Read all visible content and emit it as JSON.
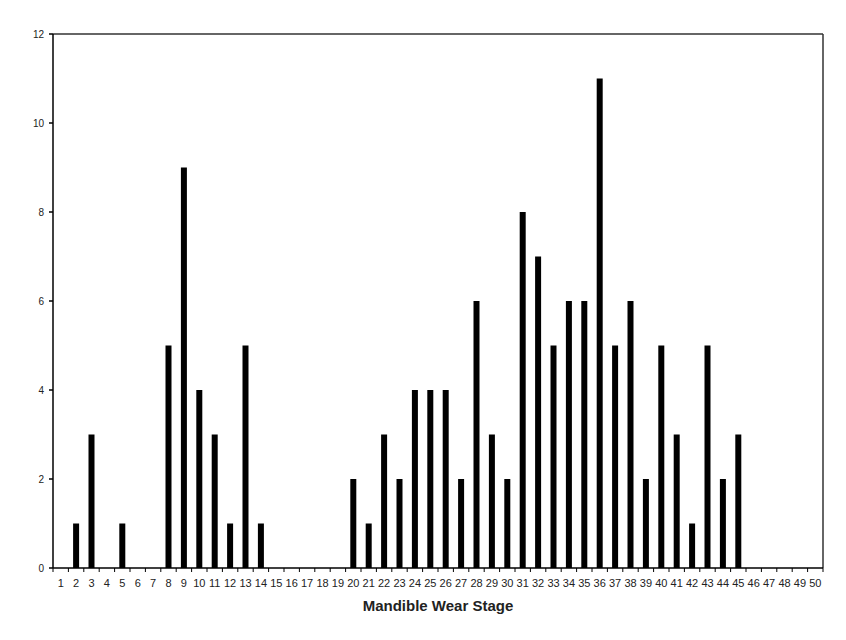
{
  "chart_data": {
    "type": "bar",
    "title": "",
    "xlabel": "Mandible Wear Stage",
    "ylabel": "",
    "ylim": [
      0,
      12
    ],
    "yticks": [
      0,
      2,
      4,
      6,
      8,
      10,
      12
    ],
    "grid": false,
    "legend": null,
    "bar_color": "#000000",
    "categories": [
      "1",
      "2",
      "3",
      "4",
      "5",
      "6",
      "7",
      "8",
      "9",
      "10",
      "11",
      "12",
      "13",
      "14",
      "15",
      "16",
      "17",
      "18",
      "19",
      "20",
      "21",
      "22",
      "23",
      "24",
      "25",
      "26",
      "27",
      "28",
      "29",
      "30",
      "31",
      "32",
      "33",
      "34",
      "35",
      "36",
      "37",
      "38",
      "39",
      "40",
      "41",
      "42",
      "43",
      "44",
      "45",
      "46",
      "47",
      "48",
      "49",
      "50"
    ],
    "values": [
      0,
      1,
      3,
      0,
      1,
      0,
      0,
      5,
      9,
      4,
      3,
      1,
      5,
      1,
      0,
      0,
      0,
      0,
      0,
      2,
      1,
      3,
      2,
      4,
      4,
      4,
      2,
      6,
      3,
      2,
      8,
      7,
      5,
      6,
      6,
      11,
      5,
      6,
      2,
      5,
      3,
      1,
      5,
      2,
      3,
      0,
      0,
      0,
      0,
      0
    ]
  }
}
